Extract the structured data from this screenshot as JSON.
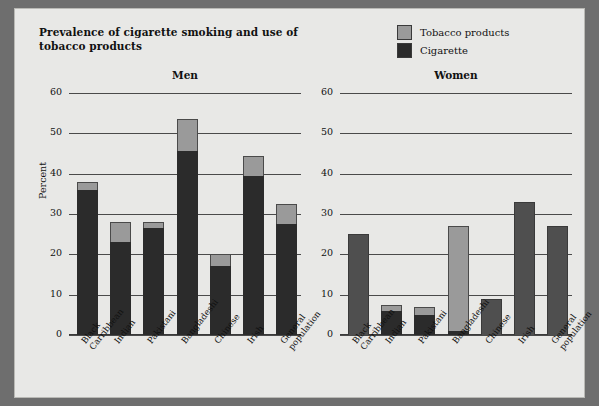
{
  "figure": {
    "title": "Prevalence of cigarette smoking and use of tobacco products",
    "ylabel": "Percent"
  },
  "legend": {
    "items": [
      {
        "label": "Tobacco products",
        "color": "#9a9a9a",
        "name": "tobacco-products"
      },
      {
        "label": "Cigarette",
        "color": "#2b2b2b",
        "name": "cigarette"
      }
    ]
  },
  "panels": [
    {
      "key": "men",
      "title": "Men"
    },
    {
      "key": "women",
      "title": "Women"
    }
  ],
  "axis": {
    "ticks": [
      "60",
      "50",
      "40",
      "30",
      "20",
      "10",
      "0"
    ],
    "min": 0,
    "max": 60,
    "step": 10
  },
  "categories": [
    "Black Carribbean",
    "Indian",
    "Pakistani",
    "Bangladeshi",
    "Chinese",
    "Irish",
    "General population"
  ],
  "chart_data": {
    "type": "bar",
    "title": "Prevalence of cigarette smoking and use of tobacco products",
    "xlabel": "",
    "ylabel": "Percent",
    "ylim": [
      0,
      60
    ],
    "ytick_step": 10,
    "grid": true,
    "legend_position": "top-right",
    "stacked": true,
    "panels": [
      {
        "name": "Men",
        "categories": [
          "Black Carribbean",
          "Indian",
          "Pakistani",
          "Bangladeshi",
          "Chinese",
          "Irish",
          "General population"
        ],
        "series": [
          {
            "name": "Cigarette",
            "values": [
              36,
              23,
              26.5,
              45.5,
              17,
              39.5,
              27.5
            ]
          },
          {
            "name": "Tobacco products",
            "values": [
              38,
              28,
              28,
              53.5,
              20,
              44.5,
              32.5
            ]
          }
        ]
      },
      {
        "name": "Women",
        "categories": [
          "Black Carribbean",
          "Indian",
          "Pakistani",
          "Bangladeshi",
          "Chinese",
          "Irish",
          "General population"
        ],
        "series": [
          {
            "name": "Cigarette",
            "values": [
              25,
              6,
              5,
              1,
              9,
              33,
              27
            ]
          },
          {
            "name": "Tobacco products",
            "values": [
              25,
              7.5,
              7,
              27,
              9,
              33,
              27
            ]
          }
        ]
      }
    ]
  }
}
